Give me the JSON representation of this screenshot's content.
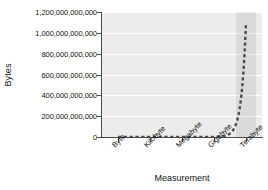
{
  "chart_data": {
    "type": "line",
    "title": "",
    "xlabel": "Measurement",
    "ylabel": "Bytes",
    "categories": [
      "Byte",
      "Kilobyte",
      "Megabyte",
      "Gigabyte",
      "Terabyte"
    ],
    "values": [
      1,
      1000,
      1000000,
      1000000000,
      1099511627776
    ],
    "ylim": [
      0,
      1200000000000
    ],
    "yticks": [
      0,
      200000000000,
      400000000000,
      600000000000,
      800000000000,
      1000000000000,
      1200000000000
    ],
    "ytick_labels": [
      "0",
      "200,000,000,000",
      "400,000,000,000",
      "600,000,000,000",
      "800,000,000,000",
      "1,000,000,000,000",
      "1,200,000,000,000"
    ],
    "grid": true,
    "gridline_color": "#ffffff",
    "plot_background": "#ececec",
    "series_style": "dashed",
    "series_color": "#4d4d4d",
    "legend": "none",
    "highlight_band": {
      "category": "Terabyte",
      "color": "#d9d9d9"
    },
    "xtick_label_rotation": -45
  },
  "axes": {
    "y_title": "Bytes",
    "x_title": "Measurement"
  }
}
